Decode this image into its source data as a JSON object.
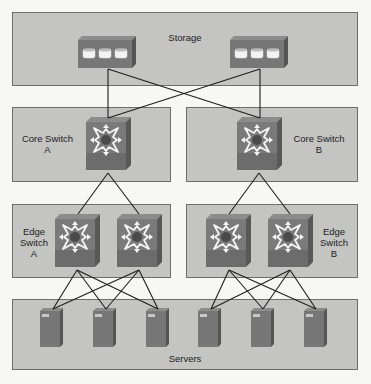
{
  "diagram": {
    "colors": {
      "zone_fill": "#c4c4c2",
      "zone_border": "#6e6e6e",
      "device_front": "#757575",
      "device_side": "#5a5a5a",
      "device_top": "#8a8a8a",
      "wire": "#1e1e1e",
      "background": "#f7f7f5"
    },
    "zones": {
      "storage": {
        "label": "Storage"
      },
      "core_a": {
        "label_line1": "Core Switch",
        "label_line2": "A"
      },
      "core_b": {
        "label_line1": "Core Switch",
        "label_line2": "B"
      },
      "edge_a": {
        "label_line1": "Edge",
        "label_line2": "Switch",
        "label_line3": "A"
      },
      "edge_b": {
        "label_line1": "Edge",
        "label_line2": "Switch",
        "label_line3": "B"
      },
      "servers": {
        "label": "Servers"
      }
    },
    "devices": {
      "storage_arrays": [
        {
          "id": "storage-1",
          "disks": 3
        },
        {
          "id": "storage-2",
          "disks": 3
        }
      ],
      "core_switches": [
        {
          "id": "core-switch-a"
        },
        {
          "id": "core-switch-b"
        }
      ],
      "edge_switches": [
        {
          "id": "edge-switch-a1"
        },
        {
          "id": "edge-switch-a2"
        },
        {
          "id": "edge-switch-b1"
        },
        {
          "id": "edge-switch-b2"
        }
      ],
      "servers": [
        {
          "id": "server-1"
        },
        {
          "id": "server-2"
        },
        {
          "id": "server-3"
        },
        {
          "id": "server-4"
        },
        {
          "id": "server-5"
        },
        {
          "id": "server-6"
        }
      ]
    },
    "links": [
      [
        "storage-1",
        "core-switch-a"
      ],
      [
        "storage-1",
        "core-switch-b"
      ],
      [
        "storage-2",
        "core-switch-a"
      ],
      [
        "storage-2",
        "core-switch-b"
      ],
      [
        "core-switch-a",
        "edge-switch-a1"
      ],
      [
        "core-switch-a",
        "edge-switch-a2"
      ],
      [
        "core-switch-b",
        "edge-switch-b1"
      ],
      [
        "core-switch-b",
        "edge-switch-b2"
      ],
      [
        "edge-switch-a1",
        "server-1"
      ],
      [
        "edge-switch-a1",
        "server-2"
      ],
      [
        "edge-switch-a1",
        "server-3"
      ],
      [
        "edge-switch-a2",
        "server-1"
      ],
      [
        "edge-switch-a2",
        "server-2"
      ],
      [
        "edge-switch-a2",
        "server-3"
      ],
      [
        "edge-switch-b1",
        "server-4"
      ],
      [
        "edge-switch-b1",
        "server-5"
      ],
      [
        "edge-switch-b1",
        "server-6"
      ],
      [
        "edge-switch-b2",
        "server-4"
      ],
      [
        "edge-switch-b2",
        "server-5"
      ],
      [
        "edge-switch-b2",
        "server-6"
      ]
    ]
  }
}
